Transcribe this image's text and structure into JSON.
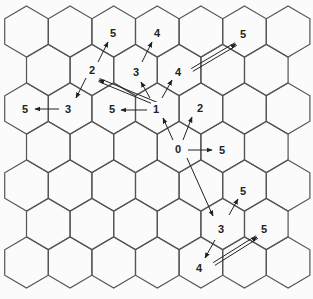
{
  "diagram": {
    "type": "hexagonal-grid",
    "grid": {
      "rows": 7,
      "orientation": "pointy-top",
      "hex_width": 43.6,
      "row_spacing": 38.5,
      "side": 25.5,
      "origin_x": 26.5,
      "origin_y": 31.5,
      "stroke_color": "#555555"
    },
    "labels": [
      {
        "id": "n0",
        "text": "0",
        "x": 178,
        "y": 149
      },
      {
        "id": "n1",
        "text": "1",
        "x": 156,
        "y": 109
      },
      {
        "id": "n2a",
        "text": "2",
        "x": 200,
        "y": 108
      },
      {
        "id": "n2b",
        "text": "2",
        "x": 92,
        "y": 70
      },
      {
        "id": "n3a",
        "text": "3",
        "x": 136,
        "y": 72
      },
      {
        "id": "n3b",
        "text": "3",
        "x": 68,
        "y": 109
      },
      {
        "id": "n3c",
        "text": "3",
        "x": 221,
        "y": 229
      },
      {
        "id": "n4a",
        "text": "4",
        "x": 157,
        "y": 33
      },
      {
        "id": "n4b",
        "text": "4",
        "x": 178,
        "y": 72
      },
      {
        "id": "n4c",
        "text": "4",
        "x": 199,
        "y": 268
      },
      {
        "id": "n5a",
        "text": "5",
        "x": 113,
        "y": 33
      },
      {
        "id": "n5b",
        "text": "5",
        "x": 243,
        "y": 34
      },
      {
        "id": "n5c",
        "text": "5",
        "x": 25,
        "y": 109
      },
      {
        "id": "n5d",
        "text": "5",
        "x": 112,
        "y": 109
      },
      {
        "id": "n5e",
        "text": "5",
        "x": 222,
        "y": 150
      },
      {
        "id": "n5f",
        "text": "5",
        "x": 243,
        "y": 191
      },
      {
        "id": "n5g",
        "text": "5",
        "x": 264,
        "y": 229
      }
    ],
    "arrows": [
      {
        "from": [
          173,
          140
        ],
        "to": [
          163,
          118
        ],
        "style": "single"
      },
      {
        "from": [
          183,
          140
        ],
        "to": [
          192,
          117
        ],
        "style": "single"
      },
      {
        "from": [
          188,
          150
        ],
        "to": [
          212,
          150
        ],
        "style": "single"
      },
      {
        "from": [
          187,
          158
        ],
        "to": [
          213,
          216
        ],
        "style": "single"
      },
      {
        "from": [
          147,
          110
        ],
        "to": [
          121,
          110
        ],
        "style": "single"
      },
      {
        "from": [
          162,
          98
        ],
        "to": [
          172,
          80
        ],
        "style": "single"
      },
      {
        "from": [
          150,
          98
        ],
        "to": [
          141,
          82
        ],
        "style": "single"
      },
      {
        "from": [
          157,
          104
        ],
        "to": [
          99,
          80
        ],
        "style": "double"
      },
      {
        "from": [
          59,
          109
        ],
        "to": [
          35,
          109
        ],
        "style": "single"
      },
      {
        "from": [
          86,
          78
        ],
        "to": [
          76,
          98
        ],
        "style": "single"
      },
      {
        "from": [
          98,
          62
        ],
        "to": [
          108,
          42
        ],
        "style": "single"
      },
      {
        "from": [
          142,
          62
        ],
        "to": [
          152,
          42
        ],
        "style": "single"
      },
      {
        "from": [
          192,
          70
        ],
        "to": [
          236,
          44
        ],
        "style": "double"
      },
      {
        "from": [
          229,
          215
        ],
        "to": [
          238,
          199
        ],
        "style": "single"
      },
      {
        "from": [
          215,
          240
        ],
        "to": [
          205,
          258
        ],
        "style": "single"
      },
      {
        "from": [
          214,
          264
        ],
        "to": [
          257,
          237
        ],
        "style": "double"
      }
    ]
  }
}
